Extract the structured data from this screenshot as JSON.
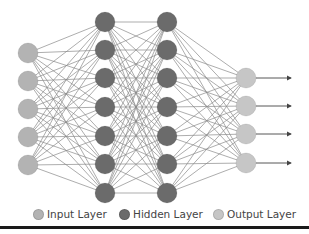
{
  "diagram": {
    "title": "",
    "colors": {
      "input": "#b3b3b3",
      "hidden": "#6b6b6b",
      "output": "#c6c6c6",
      "edge": "#8a8a8a",
      "arrow": "#444444",
      "bottom_rule": "#1a1a1a"
    },
    "layers": [
      {
        "name": "input",
        "x": 28,
        "nodes_y": [
          53,
          81,
          109,
          137,
          165
        ]
      },
      {
        "name": "hidden1",
        "x": 105,
        "nodes_y": [
          22,
          50,
          78,
          107,
          136,
          164,
          193
        ]
      },
      {
        "name": "hidden2",
        "x": 167,
        "nodes_y": [
          22,
          50,
          78,
          107,
          136,
          164,
          193
        ]
      },
      {
        "name": "output",
        "x": 246,
        "nodes_y": [
          78,
          106,
          134,
          163
        ]
      }
    ],
    "node_radius": 10,
    "output_arrow_end_x": 291
  },
  "legend": {
    "items": [
      {
        "label": "Input Layer",
        "color": "#b3b3b3"
      },
      {
        "label": "Hidden Layer",
        "color": "#6b6b6b"
      },
      {
        "label": "Output Layer",
        "color": "#c6c6c6"
      }
    ]
  }
}
